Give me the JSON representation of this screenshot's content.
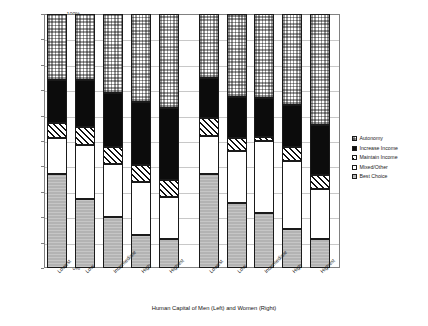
{
  "chart_data": {
    "type": "bar",
    "title": "",
    "subtype": "stacked-percentage",
    "xlabel": "Human Capital of Men (Left) and Women (Right)",
    "ylabel": "Proportion All Business Creation",
    "ylim": [
      0,
      100
    ],
    "yticks": [
      "0%",
      "10%",
      "20%",
      "30%",
      "40%",
      "50%",
      "60%",
      "70%",
      "80%",
      "90%",
      "100%"
    ],
    "grid": true,
    "legend_position": "right",
    "categories": [
      "Lowest",
      "Low",
      "Intermediate",
      "High",
      "Highest"
    ],
    "groups": [
      {
        "name": "Men (Left)"
      },
      {
        "name": "Women (Right)"
      }
    ],
    "series": [
      {
        "name": "Best Choice",
        "pattern": "fine-dotted-gray",
        "color": "#b3b3b3",
        "men": [
          37.0,
          27.0,
          20.0,
          13.0,
          11.5
        ],
        "women": [
          37.0,
          25.5,
          21.5,
          15.5,
          11.5
        ]
      },
      {
        "name": "Mixed/Other",
        "pattern": "solid-white",
        "color": "#ffffff",
        "men": [
          14.0,
          21.5,
          21.0,
          21.0,
          16.5
        ],
        "women": [
          15.0,
          20.5,
          28.5,
          26.5,
          19.5
        ]
      },
      {
        "name": "Maintain Income",
        "pattern": "diagonal-hatch",
        "color": "#ffffff",
        "men": [
          6.0,
          7.0,
          6.5,
          6.5,
          6.5
        ],
        "women": [
          7.0,
          5.0,
          1.5,
          5.5,
          5.5
        ]
      },
      {
        "name": "Increase Income",
        "pattern": "solid-black",
        "color": "#0c0c0c",
        "men": [
          17.0,
          18.5,
          21.5,
          25.0,
          28.5
        ],
        "women": [
          16.0,
          16.5,
          15.5,
          16.5,
          20.0
        ]
      },
      {
        "name": "Autonomy",
        "pattern": "checkerboard",
        "color": "#ffffff",
        "men": [
          26.0,
          26.0,
          31.0,
          34.5,
          37.0
        ],
        "women": [
          25.0,
          32.5,
          33.0,
          36.0,
          43.5
        ]
      }
    ]
  },
  "legend": {
    "items": [
      {
        "label": "Autonomy",
        "fill": "f-autonomy"
      },
      {
        "label": "Increase Income",
        "fill": "f-increase"
      },
      {
        "label": "Maintain Income",
        "fill": "f-maintain"
      },
      {
        "label": "Mixed/Other",
        "fill": "f-mixed"
      },
      {
        "label": "Best Choice",
        "fill": "f-best"
      }
    ]
  }
}
